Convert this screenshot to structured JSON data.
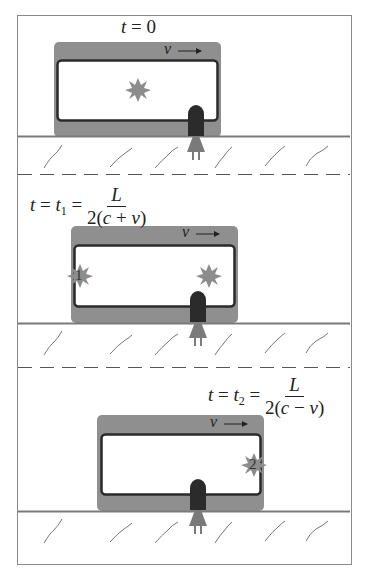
{
  "figure": {
    "colors": {
      "car_body": "#8f8f8f",
      "car_window_border": "#2a2a2a",
      "flash": "#8c8c8c",
      "ground_line": "#7a7a7a",
      "person": "#2b2b2b",
      "person_dress": "#7a7a7a",
      "frame": "#8a8a8a"
    },
    "panels": [
      {
        "label_lhs": "t",
        "label_eq": "= 0",
        "velocity_label": "v",
        "velocity_arrow": "→",
        "flash_label": ""
      },
      {
        "label_lhs": "t",
        "label_mid": "= t",
        "label_sub": "1",
        "label_eq": "=",
        "frac_num": "L",
        "frac_den_pre": "2(",
        "frac_den_c": "c",
        "frac_den_op": " + ",
        "frac_den_v": "v",
        "frac_den_post": ")",
        "velocity_label": "v",
        "velocity_arrow": "→",
        "flash_label": "1"
      },
      {
        "label_lhs": "t",
        "label_mid": "= t",
        "label_sub": "2",
        "label_eq": "=",
        "frac_num": "L",
        "frac_den_pre": "2(",
        "frac_den_c": "c",
        "frac_den_op": " − ",
        "frac_den_v": "v",
        "frac_den_post": ")",
        "velocity_label": "v",
        "velocity_arrow": "→",
        "flash_label": "2"
      }
    ]
  }
}
